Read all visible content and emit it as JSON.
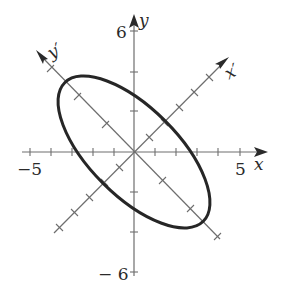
{
  "figure": {
    "axes": {
      "x": {
        "label": "x",
        "min_label": "−5",
        "max_label": "5",
        "range": [
          -5,
          5
        ],
        "tick_step": 1
      },
      "y": {
        "label": "y",
        "min_label": "− 6",
        "max_label": "6",
        "range": [
          -6,
          6
        ],
        "tick_step": 2
      },
      "x_prime": {
        "label": "x′",
        "angle_deg": 45,
        "tick_step": 1
      },
      "y_prime": {
        "label": "y′",
        "angle_deg": 135,
        "tick_step": 2
      }
    },
    "ellipse": {
      "center": [
        0,
        0
      ],
      "major_axis_direction": "y'",
      "semi_major": 4.8,
      "semi_minor": 2.15,
      "rotation_deg": 45
    },
    "colors": {
      "curve": "#262626",
      "axis": "#6e6e6e",
      "text": "#2a2a2a",
      "background": "#ffffff"
    }
  }
}
